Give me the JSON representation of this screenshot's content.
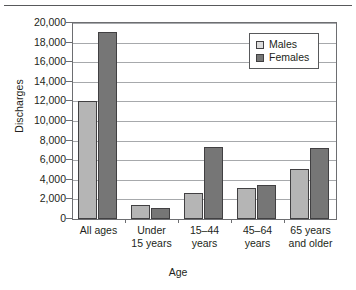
{
  "chart_data": {
    "type": "bar",
    "title": "",
    "xlabel": "Age",
    "ylabel": "Discharges",
    "categories": [
      "All ages",
      "Under 15 years",
      "15–44 years",
      "45–64 years",
      "65 years and older"
    ],
    "category_lines": [
      [
        "All ages"
      ],
      [
        "Under",
        "15 years"
      ],
      [
        "15–44",
        "years"
      ],
      [
        "45–64",
        "years"
      ],
      [
        "65 years",
        "and older"
      ]
    ],
    "series": [
      {
        "name": "Males",
        "color": "#b5b5b5",
        "values": [
          12000,
          1400,
          2700,
          3200,
          5100
        ]
      },
      {
        "name": "Females",
        "color": "#767676",
        "values": [
          19100,
          1100,
          7300,
          3500,
          7200
        ]
      }
    ],
    "ylim": [
      0,
      20000
    ],
    "ytick_step": 2000,
    "yticks": [
      0,
      2000,
      4000,
      6000,
      8000,
      10000,
      12000,
      14000,
      16000,
      18000,
      20000
    ],
    "ytick_labels": [
      "0",
      "2,000",
      "4,000",
      "6,000",
      "8,000",
      "10,000",
      "12,000",
      "14,000",
      "16,000",
      "18,000",
      "20,000"
    ],
    "grid": true,
    "legend_position": "top-right",
    "legend_entries": [
      "Males",
      "Females"
    ]
  }
}
